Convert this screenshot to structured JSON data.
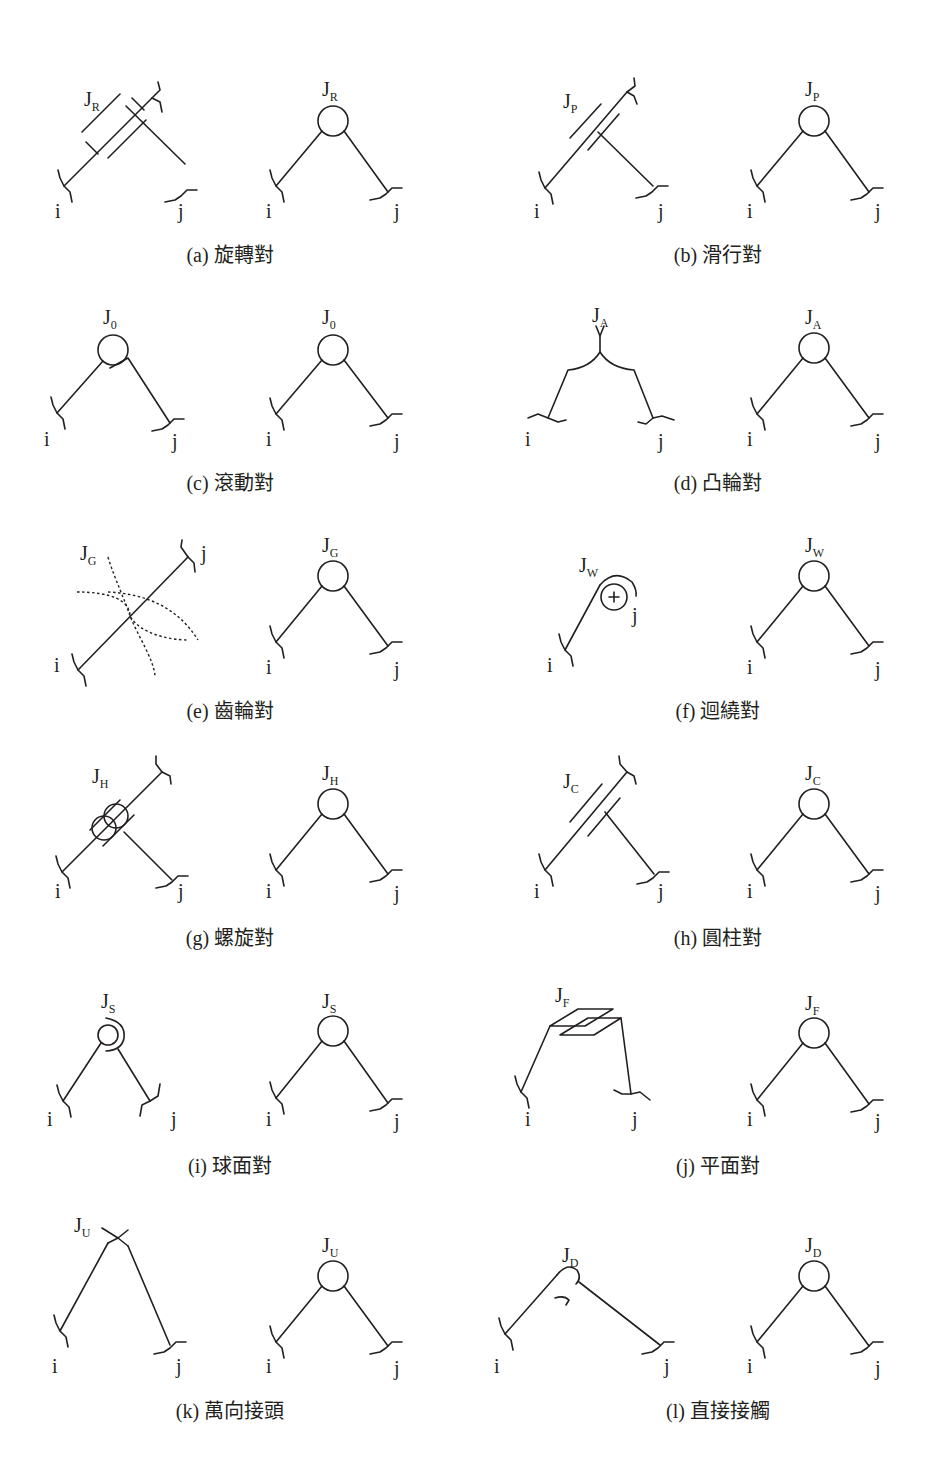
{
  "figure": {
    "colors": {
      "ink": "#231f20",
      "background": "#ffffff"
    },
    "link_labels": {
      "i": "i",
      "j": "j"
    },
    "joint_symbol": "J",
    "panels": [
      {
        "id": "a",
        "caption": "(a) 旋轉對",
        "joint_sub": "R",
        "name": "revolute pair"
      },
      {
        "id": "b",
        "caption": "(b) 滑行對",
        "joint_sub": "P",
        "name": "prismatic pair"
      },
      {
        "id": "c",
        "caption": "(c) 滾動對",
        "joint_sub": "0",
        "name": "rolling pair"
      },
      {
        "id": "d",
        "caption": "(d) 凸輪對",
        "joint_sub": "A",
        "name": "cam pair"
      },
      {
        "id": "e",
        "caption": "(e) 齒輪對",
        "joint_sub": "G",
        "name": "gear pair"
      },
      {
        "id": "f",
        "caption": "(f) 迴繞對",
        "joint_sub": "W",
        "name": "wrapping pair"
      },
      {
        "id": "g",
        "caption": "(g) 螺旋對",
        "joint_sub": "H",
        "name": "helical pair"
      },
      {
        "id": "h",
        "caption": "(h) 圓柱對",
        "joint_sub": "C",
        "name": "cylindrical pair"
      },
      {
        "id": "i",
        "caption": "(i) 球面對",
        "joint_sub": "S",
        "name": "spherical pair"
      },
      {
        "id": "j",
        "caption": "(j) 平面對",
        "joint_sub": "F",
        "name": "planar pair"
      },
      {
        "id": "k",
        "caption": "(k) 萬向接頭",
        "joint_sub": "U",
        "name": "universal joint"
      },
      {
        "id": "l",
        "caption": "(l) 直接接觸",
        "joint_sub": "D",
        "name": "direct contact"
      }
    ]
  }
}
